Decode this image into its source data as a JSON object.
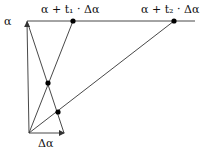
{
  "diagram": {
    "labels": {
      "alpha": "α",
      "point1": "α + t₁ · Δα",
      "point2": "α + t₂ · Δα",
      "delta": "Δα"
    },
    "colors": {
      "line": "#333333",
      "dot": "#000000",
      "background": "#ffffff"
    },
    "points": {
      "origin": [
        29,
        133
      ],
      "alpha_tip": [
        27,
        21
      ],
      "delta_tip": [
        64,
        133
      ],
      "p1": [
        73,
        21
      ],
      "p2": [
        174,
        21
      ],
      "intersection1": [
        48,
        83
      ],
      "intersection2": [
        58,
        112
      ]
    }
  }
}
